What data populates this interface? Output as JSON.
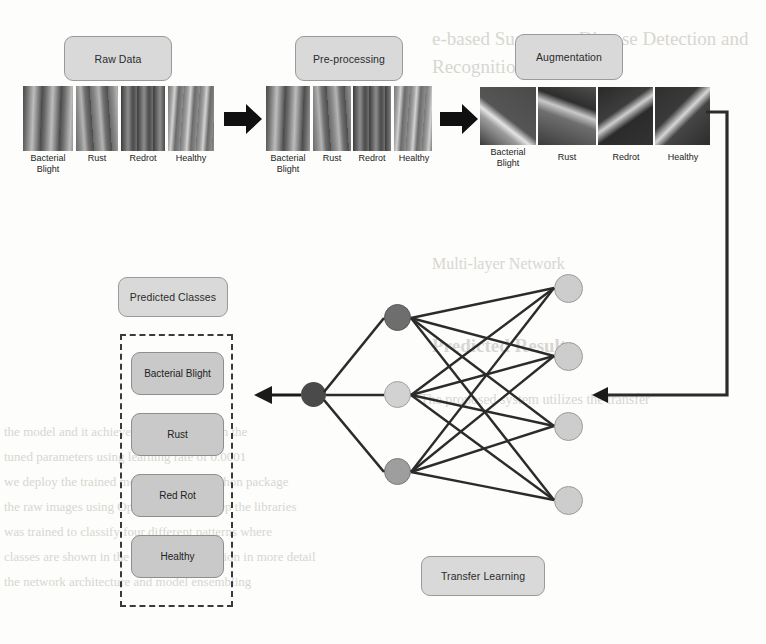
{
  "figure": {
    "type": "pipeline-diagram",
    "stages": [
      {
        "label": "Raw Data"
      },
      {
        "label": "Pre-processing"
      },
      {
        "label": "Augmentation"
      }
    ],
    "sample_labels": [
      "Bacterial\nBlight",
      "Rust",
      "Redrot",
      "Healthy"
    ],
    "arrows": [
      "raw-to-preprocessing",
      "preprocessing-to-augmentation",
      "augmentation-to-network",
      "network-to-predicted-classes"
    ],
    "predicted_classes_label": "Predicted Classes",
    "predicted_classes": [
      "Bacterial Blight",
      "Rust",
      "Red Rot",
      "Healthy"
    ],
    "transfer_learning_label": "Transfer Learning",
    "network": {
      "layers": [
        {
          "name": "input-layer",
          "count": 4,
          "fill": "#cfcfcf"
        },
        {
          "name": "hidden-layer",
          "count": 3,
          "fill": "#bdbdbd"
        },
        {
          "name": "output-layer",
          "count": 1,
          "fill": "#4a4a4a"
        }
      ],
      "node_colors": {
        "light": "#cfcfcf",
        "mid": "#9e9e9e",
        "dark": "#6e6e6e",
        "darkest": "#4a4a4a"
      },
      "edge_color": "#2b2b2b"
    },
    "colors": {
      "stage_box_fill": "#d9d9d9",
      "class_box_fill": "#c9c9c9",
      "dashed_border": "#3a3a3a",
      "arrow": "#1a1a1a",
      "background": "#fdfdfb"
    }
  },
  "bleed_text": {
    "top_line_1": "e-based Sugarcane Disease Detection and",
    "top_line_2": "Recognition in Detail",
    "mid_line_1": "Multi-layer Network",
    "mid_line_2": "Predicted Result",
    "mid_line_3": "The proposed system utilizes the transfer",
    "body_1": "the model and it achieves high accuracy on the",
    "body_2": "tuned parameters using learning rate of 0.0001",
    "body_3": "we deploy the trained model using the Python package",
    "body_4": "the raw images using OpenCV and we keep the libraries",
    "body_5": "was trained to classify four different patterns where",
    "body_6": "classes are shown in the experimental section in more detail",
    "body_7": "the network architecture and model ensembling"
  }
}
